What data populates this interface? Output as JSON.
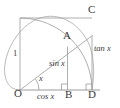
{
  "figure": {
    "stroke_color": "#8a8a8a",
    "label_color": "#3a3a3a",
    "background": "#ffffff",
    "points": {
      "O": "O",
      "A": "A",
      "B": "B",
      "C": "C",
      "D": "D"
    },
    "segment_labels": {
      "radius": "1",
      "sine": "sin x",
      "cosine": "cos x",
      "tangent": "tan x",
      "angle": "x"
    },
    "geometry": {
      "origin_x": 20,
      "origin_y": 90,
      "radius": 72,
      "angle_degrees": 37,
      "point_A_x": 67.5,
      "point_A_y": 46.7,
      "point_B_x": 67.5,
      "point_B_y": 90,
      "point_C_x": 92,
      "point_C_y": 35.8,
      "point_D_x": 92,
      "point_D_y": 90,
      "square_top_y": 18,
      "square_right_x": 92
    }
  }
}
